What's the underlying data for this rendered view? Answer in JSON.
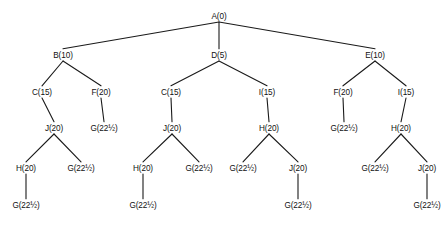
{
  "diagram": {
    "type": "search-tree",
    "background_color": "#ffffff",
    "line_color": "#1a1a1a",
    "text_color": "#111111",
    "label_format": "NAME(COST)",
    "canvas": {
      "width": 444,
      "height": 232
    },
    "levels": [
      {
        "index": 0,
        "label_y": 19
      },
      {
        "index": 1,
        "label_y": 58
      },
      {
        "index": 2,
        "label_y": 95
      },
      {
        "index": 3,
        "label_y": 131
      },
      {
        "index": 4,
        "label_y": 171
      },
      {
        "index": 5,
        "label_y": 208
      }
    ],
    "nodes": [
      {
        "id": "n0",
        "name": "A",
        "cost": "0",
        "label": "A(0)",
        "x": 219,
        "y": 19,
        "level": 0
      },
      {
        "id": "n1",
        "name": "B",
        "cost": "10",
        "label": "B(10)",
        "x": 63,
        "y": 58,
        "level": 1
      },
      {
        "id": "n2",
        "name": "D",
        "cost": "5",
        "label": "D(5)",
        "x": 219,
        "y": 58,
        "level": 1
      },
      {
        "id": "n3",
        "name": "E",
        "cost": "10",
        "label": "E(10)",
        "x": 375,
        "y": 58,
        "level": 1
      },
      {
        "id": "n4",
        "name": "C",
        "cost": "15",
        "label": "C(15)",
        "x": 42,
        "y": 95,
        "level": 2
      },
      {
        "id": "n5",
        "name": "F",
        "cost": "20",
        "label": "F(20)",
        "x": 101,
        "y": 95,
        "level": 2
      },
      {
        "id": "n6",
        "name": "C",
        "cost": "15",
        "label": "C(15)",
        "x": 171,
        "y": 95,
        "level": 2
      },
      {
        "id": "n7",
        "name": "I",
        "cost": "15",
        "label": "I(15)",
        "x": 267,
        "y": 95,
        "level": 2
      },
      {
        "id": "n8",
        "name": "F",
        "cost": "20",
        "label": "F(20)",
        "x": 343,
        "y": 95,
        "level": 2
      },
      {
        "id": "n9",
        "name": "I",
        "cost": "15",
        "label": "I(15)",
        "x": 406,
        "y": 95,
        "level": 2
      },
      {
        "id": "n10",
        "name": "J",
        "cost": "20",
        "label": "J(20)",
        "x": 54,
        "y": 131,
        "level": 3
      },
      {
        "id": "n11",
        "name": "G",
        "cost": "22½",
        "label": "G(22½)",
        "x": 104,
        "y": 131,
        "level": 3
      },
      {
        "id": "n12",
        "name": "J",
        "cost": "20",
        "label": "J(20)",
        "x": 172,
        "y": 131,
        "level": 3
      },
      {
        "id": "n13",
        "name": "H",
        "cost": "20",
        "label": "H(20)",
        "x": 269,
        "y": 131,
        "level": 3
      },
      {
        "id": "n14",
        "name": "G",
        "cost": "22½",
        "label": "G(22½)",
        "x": 344,
        "y": 131,
        "level": 3
      },
      {
        "id": "n15",
        "name": "H",
        "cost": "20",
        "label": "H(20)",
        "x": 401,
        "y": 131,
        "level": 3
      },
      {
        "id": "n16",
        "name": "H",
        "cost": "20",
        "label": "H(20)",
        "x": 26,
        "y": 171,
        "level": 4
      },
      {
        "id": "n17",
        "name": "G",
        "cost": "22½",
        "label": "G(22½)",
        "x": 81,
        "y": 171,
        "level": 4
      },
      {
        "id": "n18",
        "name": "H",
        "cost": "20",
        "label": "H(20)",
        "x": 143,
        "y": 171,
        "level": 4
      },
      {
        "id": "n19",
        "name": "G",
        "cost": "22½",
        "label": "G(22½)",
        "x": 199,
        "y": 171,
        "level": 4
      },
      {
        "id": "n20",
        "name": "G",
        "cost": "22½",
        "label": "G(22½)",
        "x": 243,
        "y": 171,
        "level": 4
      },
      {
        "id": "n21",
        "name": "J",
        "cost": "20",
        "label": "J(20)",
        "x": 298,
        "y": 171,
        "level": 4
      },
      {
        "id": "n22",
        "name": "G",
        "cost": "22½",
        "label": "G(22½)",
        "x": 375,
        "y": 171,
        "level": 4
      },
      {
        "id": "n23",
        "name": "J",
        "cost": "20",
        "label": "J(20)",
        "x": 427,
        "y": 171,
        "level": 4
      },
      {
        "id": "n24",
        "name": "G",
        "cost": "22½",
        "label": "G(22½)",
        "x": 26,
        "y": 208,
        "level": 5
      },
      {
        "id": "n25",
        "name": "G",
        "cost": "22½",
        "label": "G(22½)",
        "x": 143,
        "y": 208,
        "level": 5
      },
      {
        "id": "n26",
        "name": "G",
        "cost": "22½",
        "label": "G(22½)",
        "x": 298,
        "y": 208,
        "level": 5
      },
      {
        "id": "n27",
        "name": "G",
        "cost": "22½",
        "label": "G(22½)",
        "x": 427,
        "y": 208,
        "level": 5
      }
    ],
    "edges": [
      {
        "from": "n0",
        "to": "n1"
      },
      {
        "from": "n0",
        "to": "n2"
      },
      {
        "from": "n0",
        "to": "n3"
      },
      {
        "from": "n1",
        "to": "n4"
      },
      {
        "from": "n1",
        "to": "n5"
      },
      {
        "from": "n2",
        "to": "n6"
      },
      {
        "from": "n2",
        "to": "n7"
      },
      {
        "from": "n3",
        "to": "n8"
      },
      {
        "from": "n3",
        "to": "n9"
      },
      {
        "from": "n4",
        "to": "n10"
      },
      {
        "from": "n5",
        "to": "n11"
      },
      {
        "from": "n6",
        "to": "n12"
      },
      {
        "from": "n7",
        "to": "n13"
      },
      {
        "from": "n8",
        "to": "n14"
      },
      {
        "from": "n9",
        "to": "n15"
      },
      {
        "from": "n10",
        "to": "n16"
      },
      {
        "from": "n10",
        "to": "n17"
      },
      {
        "from": "n12",
        "to": "n18"
      },
      {
        "from": "n12",
        "to": "n19"
      },
      {
        "from": "n13",
        "to": "n20"
      },
      {
        "from": "n13",
        "to": "n21"
      },
      {
        "from": "n15",
        "to": "n22"
      },
      {
        "from": "n15",
        "to": "n23"
      },
      {
        "from": "n16",
        "to": "n24"
      },
      {
        "from": "n18",
        "to": "n25"
      },
      {
        "from": "n21",
        "to": "n26"
      },
      {
        "from": "n23",
        "to": "n27"
      }
    ]
  }
}
